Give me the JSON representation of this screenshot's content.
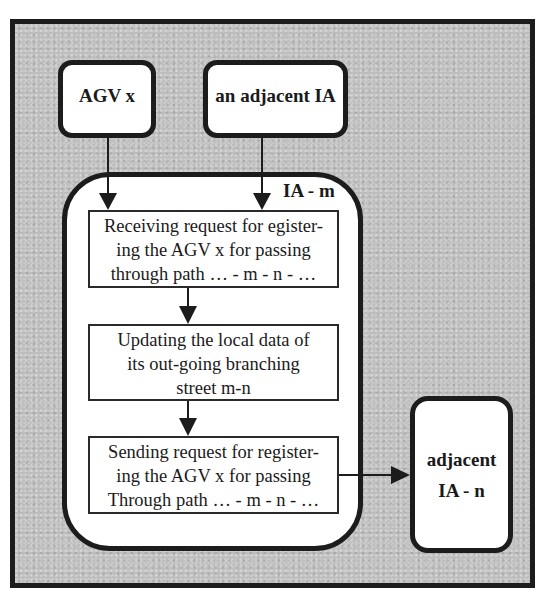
{
  "diagram": {
    "nodes": {
      "agv": {
        "label": "AGV x"
      },
      "adjacent_ia": {
        "label": "an adjacent IA"
      },
      "ia_m": {
        "label": "IA - m"
      },
      "adjacent_ia_n": {
        "line1": "adjacent",
        "line2": "IA - n"
      }
    },
    "steps": [
      {
        "lines": [
          "Receiving request for egister-",
          "ing the AGV x for passing",
          "through path … - m - n - …"
        ]
      },
      {
        "lines": [
          "Updating the local data of",
          "its out-going branching",
          "street m-n"
        ]
      },
      {
        "lines": [
          "Sending request for register-",
          "ing the AGV x for passing",
          "Through path … - m - n - …"
        ]
      }
    ],
    "edges": [
      {
        "from": "agv",
        "to": "step-1"
      },
      {
        "from": "adjacent_ia",
        "to": "step-1"
      },
      {
        "from": "step-1",
        "to": "step-2"
      },
      {
        "from": "step-2",
        "to": "step-3"
      },
      {
        "from": "step-3",
        "to": "adjacent_ia_n"
      }
    ],
    "colors": {
      "line": "#1c1c1c",
      "background": "#bdbdbd",
      "box_fill": "#ffffff"
    }
  }
}
